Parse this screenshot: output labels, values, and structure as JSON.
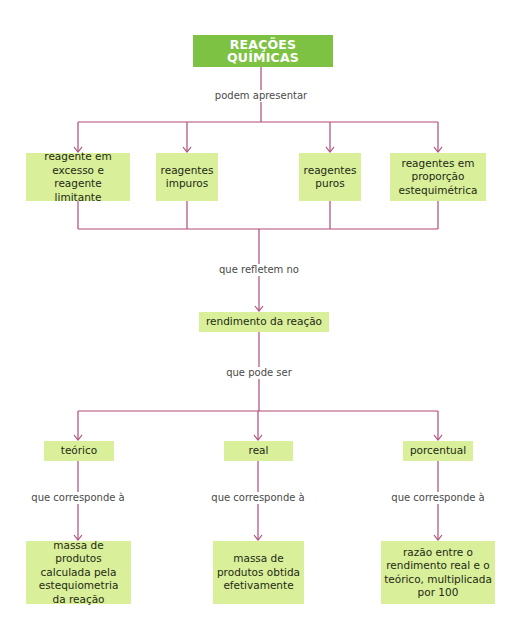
{
  "colors": {
    "title_bg": "#7dc242",
    "node_bg": "#d9ef9a",
    "line": "#b04a78",
    "label_text": "#4a4a4a"
  },
  "title": "REAÇÕES QUÍMICAS",
  "labels": {
    "l1": "podem apresentar",
    "l2": "que refletem no",
    "l3": "que pode ser",
    "l4": "que corresponde à",
    "l5": "que corresponde à",
    "l6": "que corresponde à"
  },
  "level1": [
    {
      "text": "reagente em\nexcesso e reagente\nlimitante"
    },
    {
      "text": "reagentes\nimpuros"
    },
    {
      "text": "reagentes\npuros"
    },
    {
      "text": "reagentes em\nproporção\nestequimétrica"
    }
  ],
  "center": "rendimento da reação",
  "level2": [
    {
      "text": "teórico"
    },
    {
      "text": "real"
    },
    {
      "text": "porcentual"
    }
  ],
  "level3": [
    {
      "text": "massa de produtos\ncalculada pela\nestequiometria\nda reação"
    },
    {
      "text": "massa de\nprodutos obtida\nefetivamente"
    },
    {
      "text": "razão entre o\nrendimento real e o\nteórico, multiplicada\npor 100"
    }
  ]
}
